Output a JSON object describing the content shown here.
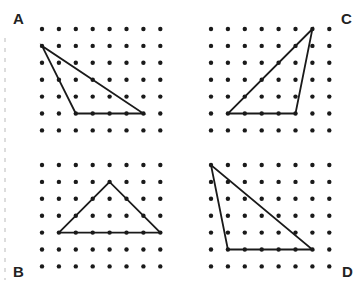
{
  "grid": {
    "cols": 8,
    "rows": 7,
    "spacing": 16.9,
    "dot_radius": 2.2,
    "dot_color": "#1a1a1a"
  },
  "line_color": "#1a1a1a",
  "panels": [
    {
      "label": "A",
      "origin": [
        42,
        29
      ],
      "label_pos": [
        13,
        11
      ],
      "triangle": [
        [
          0,
          1
        ],
        [
          2,
          5
        ],
        [
          6,
          5
        ]
      ]
    },
    {
      "label": "C",
      "origin": [
        211,
        29
      ],
      "label_pos": [
        341,
        11
      ],
      "triangle": [
        [
          6,
          0
        ],
        [
          1,
          5
        ],
        [
          5,
          5
        ]
      ]
    },
    {
      "label": "B",
      "origin": [
        42,
        165
      ],
      "label_pos": [
        13,
        264
      ],
      "triangle": [
        [
          4,
          1
        ],
        [
          1,
          4
        ],
        [
          7,
          4
        ]
      ]
    },
    {
      "label": "D",
      "origin": [
        211,
        165
      ],
      "label_pos": [
        342,
        264
      ],
      "triangle": [
        [
          0,
          0
        ],
        [
          1,
          5
        ],
        [
          6,
          5
        ]
      ]
    }
  ],
  "labels": {
    "a": "A",
    "b": "B",
    "c": "C",
    "d": "D"
  }
}
